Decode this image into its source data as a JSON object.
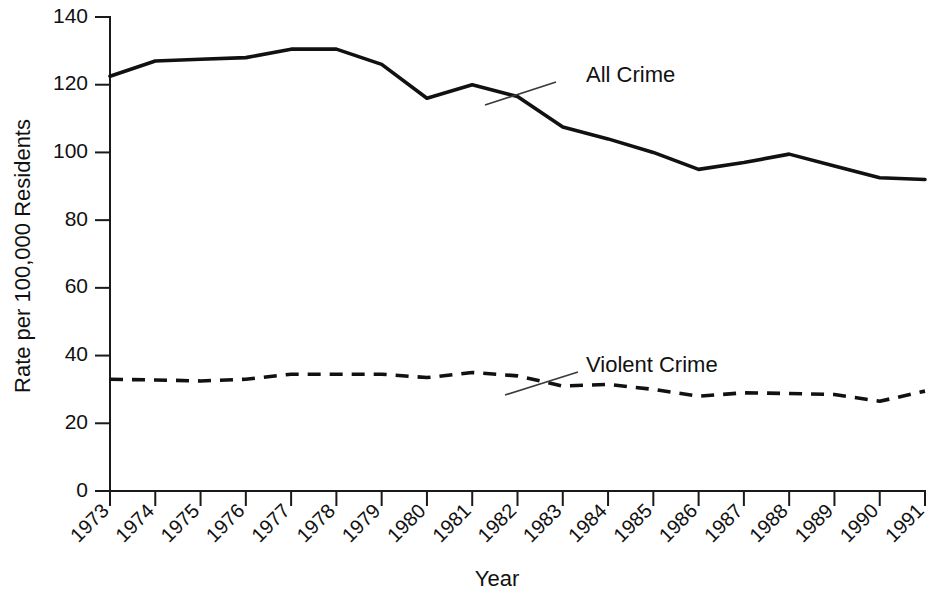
{
  "chart_data": {
    "type": "line",
    "title": "",
    "xlabel": "Year",
    "ylabel": "Rate per 100,000 Residents",
    "categories": [
      "1973",
      "1974",
      "1975",
      "1976",
      "1977",
      "1978",
      "1979",
      "1980",
      "1981",
      "1982",
      "1983",
      "1984",
      "1985",
      "1986",
      "1987",
      "1988",
      "1989",
      "1990",
      "1991"
    ],
    "x": [
      1973,
      1974,
      1975,
      1976,
      1977,
      1978,
      1979,
      1980,
      1981,
      1982,
      1983,
      1984,
      1985,
      1986,
      1987,
      1988,
      1989,
      1990,
      1991
    ],
    "xlim": [
      1973,
      1991
    ],
    "ylim": [
      0,
      140
    ],
    "yticks": [
      0,
      20,
      40,
      60,
      80,
      100,
      120,
      140
    ],
    "ytick_labels": [
      "0",
      "20",
      "40",
      "60",
      "80",
      "100",
      "120",
      "140"
    ],
    "grid": false,
    "legend": "inline-annotations",
    "series": [
      {
        "name": "All Crime",
        "style": "solid",
        "color": "#111111",
        "values": [
          122.5,
          127.0,
          127.5,
          128.0,
          130.5,
          130.5,
          126.0,
          116.0,
          120.0,
          116.5,
          107.5,
          104.0,
          100.0,
          95.0,
          97.0,
          99.5,
          96.0,
          92.5,
          92.0
        ]
      },
      {
        "name": "Violent Crime",
        "style": "dashed",
        "color": "#111111",
        "values": [
          33.0,
          32.8,
          32.5,
          33.0,
          34.5,
          34.5,
          34.5,
          33.5,
          35.0,
          34.0,
          31.0,
          31.5,
          30.0,
          28.0,
          29.0,
          28.8,
          28.5,
          26.5,
          29.5
        ]
      }
    ],
    "annotations": [
      {
        "label": "All Crime",
        "text_x": 586,
        "text_y": 76,
        "leader_from_x": 556,
        "leader_from_y": 82,
        "leader_to_x": 485,
        "leader_to_y": 105
      },
      {
        "label": "Violent Crime",
        "text_x": 586,
        "text_y": 366,
        "leader_from_x": 578,
        "leader_from_y": 372,
        "leader_to_x": 505,
        "leader_to_y": 395
      }
    ]
  },
  "axis": {
    "y_title": "Rate per 100,000 Residents",
    "x_title": "Year"
  }
}
